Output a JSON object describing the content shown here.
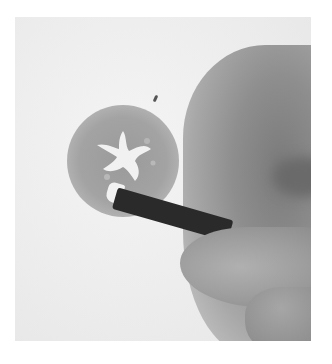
{
  "image": {
    "description": "Grayscale photo of a hand holding a dark pencil, drawing inside a shaded circle containing a white star-like figure on paper",
    "colors": {
      "background": "#ffffff",
      "paper": "#ececec",
      "circle": "#a0a0a0",
      "pencil": "#2a2a2a",
      "skin": "#8e8e8e"
    }
  }
}
